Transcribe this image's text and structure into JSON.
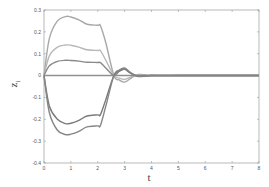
{
  "chart_data": {
    "type": "line",
    "title": "",
    "xlabel": "t",
    "ylabel": "z_i",
    "ylabel_main": "z",
    "ylabel_sub": "i",
    "xlim": [
      0,
      8
    ],
    "ylim": [
      -0.4,
      0.3
    ],
    "grid": false,
    "legend": null,
    "x_ticks": [
      0,
      1,
      2,
      3,
      4,
      5,
      6,
      7,
      8
    ],
    "x_tick_labels": [
      "0",
      "1",
      "2",
      "3",
      "4",
      "5",
      "6",
      "7",
      "8"
    ],
    "y_ticks": [
      0.3,
      0.2,
      0.1,
      0,
      -0.1,
      -0.2,
      -0.3,
      -0.4
    ],
    "y_tick_labels": [
      "0.3",
      "0.2",
      "0.1",
      "0",
      "-0.1",
      "-0.2",
      "-0.3",
      "-0.4"
    ],
    "x": [
      0,
      0.2,
      0.5,
      0.8,
      1.0,
      1.3,
      1.6,
      2.0,
      2.1,
      2.3,
      2.6,
      2.8,
      3.0,
      3.2,
      3.5,
      4.0,
      5.0,
      6.0,
      7.0,
      8.0
    ],
    "series": [
      {
        "name": "z1",
        "color": "#a8a8a8",
        "values": [
          0,
          0.17,
          0.25,
          0.27,
          0.268,
          0.255,
          0.235,
          0.23,
          0.228,
          0.15,
          0.0,
          -0.02,
          -0.03,
          -0.015,
          0.005,
          0.0,
          0,
          0,
          0,
          0
        ]
      },
      {
        "name": "z2",
        "color": "#b8b8b8",
        "values": [
          0,
          0.09,
          0.13,
          0.14,
          0.139,
          0.13,
          0.118,
          0.115,
          0.114,
          0.07,
          0.0,
          -0.012,
          -0.018,
          -0.008,
          0.003,
          0.0,
          0,
          0,
          0,
          0
        ]
      },
      {
        "name": "z3",
        "color": "#8a8a8a",
        "values": [
          0,
          0.045,
          0.065,
          0.07,
          0.069,
          0.066,
          0.061,
          0.06,
          0.059,
          0.035,
          0.0,
          0.02,
          0.03,
          0.015,
          -0.003,
          0.0,
          0,
          0,
          0,
          0
        ]
      },
      {
        "name": "z4",
        "color": "#909090",
        "values": [
          0,
          0,
          0,
          0,
          0,
          0,
          0,
          0,
          0,
          0,
          0,
          0,
          0,
          0,
          0,
          0,
          0,
          0,
          0,
          0
        ]
      },
      {
        "name": "z5",
        "color": "#7a7a7a",
        "values": [
          0,
          -0.14,
          -0.2,
          -0.22,
          -0.218,
          -0.205,
          -0.185,
          -0.18,
          -0.179,
          -0.11,
          0.0,
          0.02,
          0.03,
          0.012,
          -0.003,
          0.0,
          0,
          0,
          0,
          0
        ]
      },
      {
        "name": "z6",
        "color": "#858585",
        "values": [
          0,
          -0.17,
          -0.25,
          -0.27,
          -0.268,
          -0.255,
          -0.235,
          -0.23,
          -0.228,
          -0.14,
          0.0,
          0.025,
          0.035,
          0.015,
          -0.004,
          0.0,
          0,
          0,
          0,
          0
        ]
      }
    ]
  },
  "layout": {
    "plot_left": 44,
    "plot_right": 259,
    "plot_top": 10,
    "plot_bottom": 163
  }
}
